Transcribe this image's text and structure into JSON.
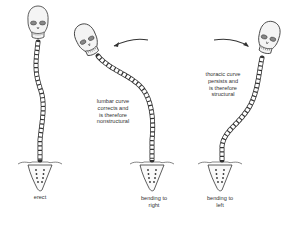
{
  "figure": {
    "panels": [
      {
        "id": "erect",
        "caption": "erect"
      },
      {
        "id": "bending-right",
        "caption": "bending to\nright",
        "annotation": "lumbar curve\ncorrects and\nis therefore\nnonstructural"
      },
      {
        "id": "bending-left",
        "caption": "bending to\nleft",
        "annotation": "thoracic curve\npersists and\nis therefore\nstructural"
      }
    ],
    "arrows": [
      {
        "id": "arrow-right-bend",
        "direction": "toward-left"
      },
      {
        "id": "arrow-left-bend",
        "direction": "toward-right"
      }
    ],
    "colors": {
      "line": "#333333",
      "fill": "#f2f2f2",
      "background": "#ffffff"
    }
  }
}
